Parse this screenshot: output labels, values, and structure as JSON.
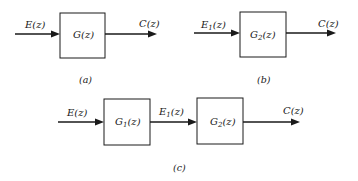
{
  "panels": [
    {
      "id": "a",
      "caption": "(a)",
      "input_label": "E(z)",
      "blocks": [
        {
          "name": "G",
          "sub": "",
          "arg": "(z)"
        }
      ],
      "output_label": "C(z)"
    },
    {
      "id": "b",
      "caption": "(b)",
      "input_label": {
        "name": "E",
        "sub": "1",
        "arg": "(z)"
      },
      "blocks": [
        {
          "name": "G",
          "sub": "2",
          "arg": "(z)"
        }
      ],
      "output_label": "C(z)"
    },
    {
      "id": "c",
      "caption": "(c)",
      "input_label": "E(z)",
      "blocks": [
        {
          "name": "G",
          "sub": "1",
          "arg": "(z)"
        },
        {
          "name": "G",
          "sub": "2",
          "arg": "(z)"
        }
      ],
      "intermediate_label": {
        "name": "E",
        "sub": "1",
        "arg": "(z)"
      },
      "output_label": "C(z)"
    }
  ],
  "colors": {
    "ink": "#1a1a1a",
    "background": "#ffffff"
  }
}
